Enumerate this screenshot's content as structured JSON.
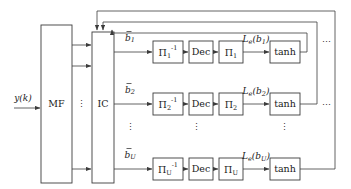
{
  "diagram": {
    "input": {
      "label": "y(k)"
    },
    "blocks": {
      "mf": {
        "label": "MF"
      },
      "ic": {
        "label": "IC"
      }
    },
    "ellipsis": {
      "mf_ic_vertical": "⋮",
      "branch_vertical": "⋮",
      "deinterleaver_vertical": "⋮",
      "decoder_vertical": "⋮",
      "tanh_vertical": "⋮",
      "row1_right": "⋯",
      "row2_right": "⋯"
    },
    "rows": [
      {
        "id": "row-1",
        "input_label": "b̅1",
        "input_label_base": "b",
        "input_label_sub": "1",
        "deinterleaver": {
          "base": "Π",
          "sub": "1",
          "sup": "-1"
        },
        "decoder": {
          "label": "Dec"
        },
        "interleaver": {
          "base": "Π",
          "sub": "1"
        },
        "extrinsic_label": {
          "base": "L",
          "sub": "e",
          "arg": "(b",
          "arg_sub": "1",
          "arg_close": ")"
        },
        "soft_map": {
          "label": "tanh"
        },
        "trailing_ellipsis": "⋯"
      },
      {
        "id": "row-2",
        "input_label": "b̅2",
        "input_label_base": "b",
        "input_label_sub": "2",
        "deinterleaver": {
          "base": "Π",
          "sub": "2",
          "sup": "-1"
        },
        "decoder": {
          "label": "Dec"
        },
        "interleaver": {
          "base": "Π",
          "sub": "2"
        },
        "extrinsic_label": {
          "base": "L",
          "sub": "e",
          "arg": "(b",
          "arg_sub": "2",
          "arg_close": ")"
        },
        "soft_map": {
          "label": "tanh"
        },
        "trailing_ellipsis": "⋯"
      },
      {
        "id": "row-U",
        "input_label": "b̅U",
        "input_label_base": "b",
        "input_label_sub": "U",
        "deinterleaver": {
          "base": "Π",
          "sub": "U",
          "sup": "-1"
        },
        "decoder": {
          "label": "Dec"
        },
        "interleaver": {
          "base": "Π",
          "sub": "U"
        },
        "extrinsic_label": {
          "base": "L",
          "sub": "e",
          "arg": "(b",
          "arg_sub": "U",
          "arg_close": ")"
        },
        "soft_map": {
          "label": "tanh"
        },
        "trailing_ellipsis": ""
      }
    ],
    "colors": {
      "stroke": "#3c3c3c",
      "text": "#1a1a1a",
      "background": "#ffffff"
    }
  }
}
